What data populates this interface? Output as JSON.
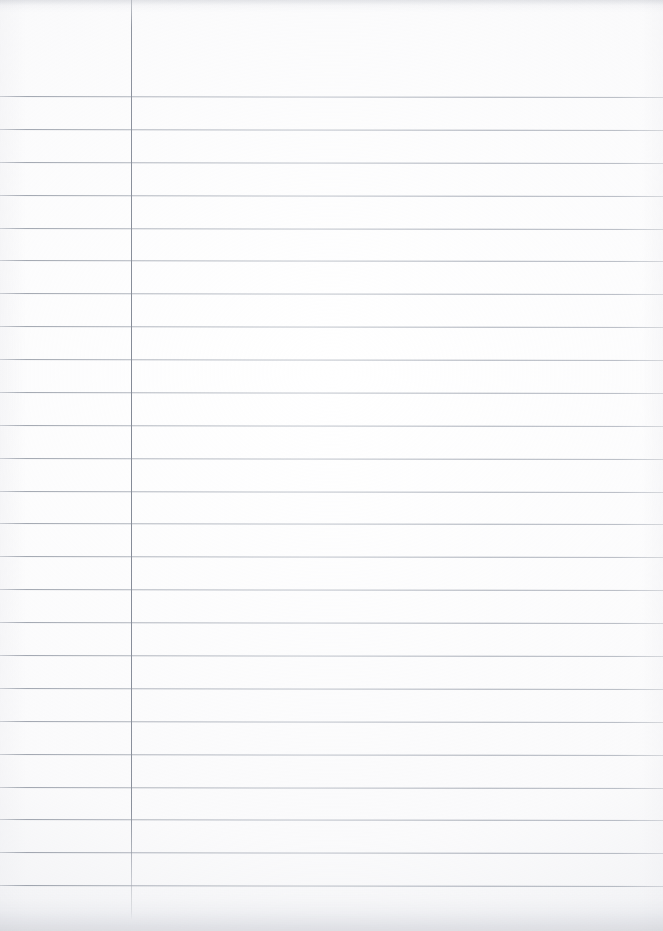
{
  "document": {
    "kind": "scanned-ruled-paper",
    "title": "",
    "page_width": 663,
    "page_height": 931,
    "background_color": "#ffffff",
    "content_text": "",
    "is_blank": "blank"
  },
  "paper": {
    "type": "ruled notebook paper",
    "orientation": "portrait",
    "paper_color": "#ffffff",
    "texture_note": "scan vignette and edge shading"
  },
  "ruling": {
    "horizontal_rule_color": "#a2a8b2",
    "horizontal_rule_count": 25,
    "first_rule_y": 96,
    "rule_spacing": 32.9,
    "rule_thickness": 1,
    "slant_degrees": 0.085,
    "rule_y_positions": [
      96,
      129,
      162,
      195,
      228,
      260,
      293,
      326,
      359,
      392,
      425,
      458,
      491,
      523,
      556,
      589,
      622,
      655,
      688,
      721,
      754,
      787,
      819,
      852,
      885
    ],
    "margin_rule": {
      "color": "#888e9b",
      "x": 131,
      "top": 0,
      "bottom": 920,
      "thickness": 1,
      "label": "left margin line"
    }
  },
  "regions": {
    "header_zone_label": "header area",
    "margin_column_label": "left margin column",
    "writing_area_label": "writing area"
  }
}
